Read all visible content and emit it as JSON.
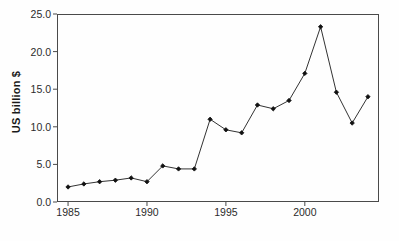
{
  "chart_data": {
    "type": "line",
    "title": "",
    "subtitle": "",
    "xlabel": "",
    "ylabel": "US billion $",
    "xlim": [
      1984.3,
      2004.7
    ],
    "ylim": [
      0.0,
      25.0
    ],
    "grid": false,
    "legend": null,
    "marker": "filled-diamond",
    "line_color": "#333333",
    "marker_color": "#111111",
    "x": [
      1985,
      1986,
      1987,
      1988,
      1989,
      1990,
      1991,
      1992,
      1993,
      1994,
      1995,
      1996,
      1997,
      1998,
      1999,
      2000,
      2001,
      2002,
      2003,
      2004
    ],
    "values": [
      2.0,
      2.4,
      2.7,
      2.9,
      3.2,
      2.7,
      4.8,
      4.4,
      4.4,
      11.0,
      9.6,
      9.2,
      12.9,
      12.4,
      13.5,
      17.1,
      23.3,
      14.6,
      10.5,
      14.0
    ],
    "xticks": [
      1985,
      1990,
      1995,
      2000
    ],
    "xtick_labels": [
      "1985",
      "1990",
      "1995",
      "2000"
    ],
    "yticks": [
      0.0,
      5.0,
      10.0,
      15.0,
      20.0,
      25.0
    ],
    "ytick_labels": [
      "0.0",
      "5.0",
      "10.0",
      "15.0",
      "20.0",
      "25.0"
    ]
  }
}
